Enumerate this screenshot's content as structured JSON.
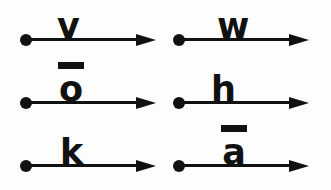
{
  "figure": {
    "background_color": "#fdfdfd",
    "ink_color": "#111111",
    "columns": 2,
    "rows": 3
  },
  "vectors": [
    {
      "id": "vector-v",
      "label": "v",
      "macron": false,
      "macron_label": "",
      "position": {
        "row": 1,
        "column": "left"
      },
      "origin_marker": "filled-dot",
      "arrow_direction": "right"
    },
    {
      "id": "vector-w",
      "label": "w",
      "macron": false,
      "macron_label": "",
      "position": {
        "row": 1,
        "column": "right"
      },
      "origin_marker": "filled-dot",
      "arrow_direction": "right"
    },
    {
      "id": "vector-o-macron",
      "label": "o",
      "macron": true,
      "macron_label": "macron-bar",
      "position": {
        "row": 2,
        "column": "left"
      },
      "origin_marker": "filled-dot",
      "arrow_direction": "right"
    },
    {
      "id": "vector-h",
      "label": "h",
      "macron": false,
      "macron_label": "",
      "position": {
        "row": 2,
        "column": "right"
      },
      "origin_marker": "filled-dot",
      "arrow_direction": "right"
    },
    {
      "id": "vector-k",
      "label": "k",
      "macron": false,
      "macron_label": "",
      "position": {
        "row": 3,
        "column": "left"
      },
      "origin_marker": "filled-dot",
      "arrow_direction": "right"
    },
    {
      "id": "vector-a-macron",
      "label": "a",
      "macron": true,
      "macron_label": "macron-bar",
      "position": {
        "row": 3,
        "column": "right"
      },
      "origin_marker": "filled-dot",
      "arrow_direction": "right"
    }
  ]
}
